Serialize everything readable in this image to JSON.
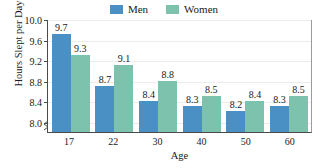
{
  "chart_data": {
    "type": "bar",
    "title": "",
    "xlabel": "Age",
    "ylabel": "Hours Slept per Day",
    "categories": [
      "17",
      "22",
      "30",
      "40",
      "50",
      "60"
    ],
    "series": [
      {
        "name": "Men",
        "color": "#4a90c4",
        "values": [
          9.7,
          8.7,
          8.4,
          8.3,
          8.2,
          8.3
        ]
      },
      {
        "name": "Women",
        "color": "#7dc2ad",
        "values": [
          9.3,
          9.1,
          8.8,
          8.5,
          8.4,
          8.5
        ]
      }
    ],
    "ylim": [
      7.8,
      10.0
    ],
    "yticks": [
      "10.0",
      "9.6",
      "9.2",
      "8.8",
      "8.4",
      "8.0"
    ],
    "ytick_values": [
      10.0,
      9.6,
      9.2,
      8.8,
      8.4,
      8.0
    ],
    "grid": true,
    "legend_position": "top-center",
    "axis_break": true,
    "axis_break_icon": "y-axis-break-zigzag"
  },
  "legend": {
    "entries": [
      {
        "label": "Men",
        "color": "#4a90c4"
      },
      {
        "label": "Women",
        "color": "#7dc2ad"
      }
    ]
  },
  "axes": {
    "y_title": "Hours Slept per Day",
    "x_title": "Age"
  }
}
